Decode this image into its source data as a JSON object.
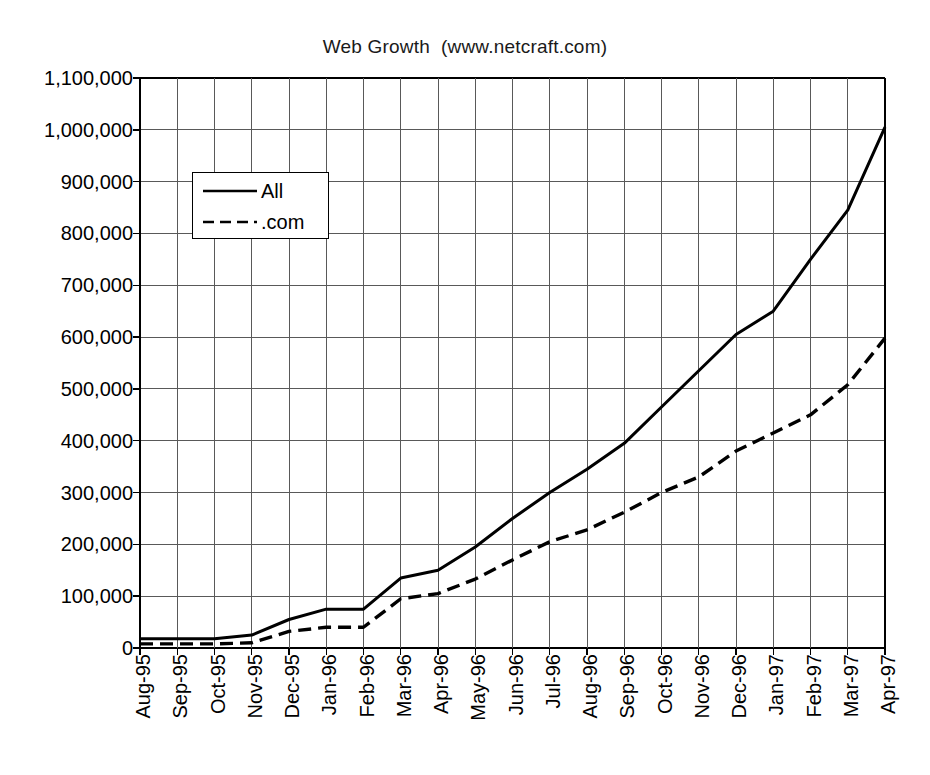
{
  "chart_data": {
    "type": "line",
    "title": "Web Growth  (www.netcraft.com)",
    "xlabel": "",
    "ylabel": "",
    "ylim": [
      0,
      1100000
    ],
    "ytick_step": 100000,
    "grid": true,
    "legend_position": "upper-left-inside",
    "categories": [
      "Aug-95",
      "Sep-95",
      "Oct-95",
      "Nov-95",
      "Dec-95",
      "Jan-96",
      "Feb-96",
      "Mar-96",
      "Apr-96",
      "May-96",
      "Jun-96",
      "Jul-96",
      "Aug-96",
      "Sep-96",
      "Oct-96",
      "Nov-96",
      "Dec-96",
      "Jan-97",
      "Feb-97",
      "Mar-97",
      "Apr-97"
    ],
    "ytick_labels": [
      "0",
      "100,000",
      "200,000",
      "300,000",
      "400,000",
      "500,000",
      "600,000",
      "700,000",
      "800,000",
      "900,000",
      "1,000,000",
      "1,100,000"
    ],
    "ytick_values": [
      0,
      100000,
      200000,
      300000,
      400000,
      500000,
      600000,
      700000,
      800000,
      900000,
      1000000,
      1100000
    ],
    "series": [
      {
        "name": "All",
        "style": "solid",
        "color": "#000000",
        "values": [
          18000,
          18000,
          18000,
          25000,
          55000,
          75000,
          75000,
          135000,
          150000,
          195000,
          250000,
          300000,
          345000,
          395000,
          465000,
          535000,
          605000,
          650000,
          750000,
          845000,
          1005000
        ]
      },
      {
        "name": ".com",
        "style": "dashed",
        "color": "#000000",
        "values": [
          8000,
          8000,
          8000,
          10000,
          32000,
          40000,
          40000,
          95000,
          105000,
          133000,
          170000,
          205000,
          228000,
          262000,
          300000,
          330000,
          380000,
          415000,
          450000,
          508000,
          598000
        ]
      }
    ]
  },
  "legend": {
    "items": [
      {
        "label": "All",
        "style": "solid"
      },
      {
        "label": ".com",
        "style": "dashed"
      }
    ]
  },
  "colors": {
    "line": "#000000",
    "grid": "#595959",
    "axis": "#000000",
    "background": "#ffffff",
    "text": "#000000"
  }
}
